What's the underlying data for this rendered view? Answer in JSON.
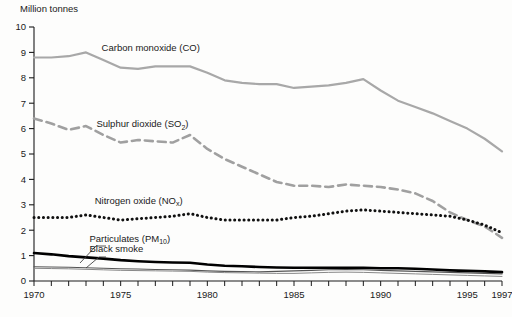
{
  "chart_data": {
    "type": "line",
    "title": "",
    "ylabel": "Million tonnes",
    "xlabel": "",
    "xlim": [
      1970,
      1997
    ],
    "ylim": [
      0,
      10
    ],
    "ytick_labels": [
      "0",
      "1",
      "2",
      "3",
      "4",
      "5",
      "6",
      "7",
      "8",
      "9",
      "10"
    ],
    "ytick_values": [
      0,
      1,
      2,
      3,
      4,
      5,
      6,
      7,
      8,
      9,
      10
    ],
    "xtick_labels": [
      "1970",
      "1975",
      "1980",
      "1985",
      "1990",
      "1995",
      "1997"
    ],
    "xtick_values": [
      1970,
      1975,
      1980,
      1985,
      1990,
      1995,
      1997
    ],
    "x": [
      1970,
      1971,
      1972,
      1973,
      1974,
      1975,
      1976,
      1977,
      1978,
      1979,
      1980,
      1981,
      1982,
      1983,
      1984,
      1985,
      1986,
      1987,
      1988,
      1989,
      1990,
      1991,
      1992,
      1993,
      1994,
      1995,
      1996,
      1997
    ],
    "grid": false,
    "legend_position": "inline-labels",
    "series": [
      {
        "name": "Carbon monoxide (CO)",
        "label_plain": "Carbon monoxide (CO)",
        "style": "solid",
        "color": "#a8a8a8",
        "width": 2.2,
        "values": [
          8.8,
          8.8,
          8.85,
          9.0,
          8.7,
          8.4,
          8.35,
          8.45,
          8.45,
          8.45,
          8.2,
          7.9,
          7.8,
          7.75,
          7.75,
          7.6,
          7.65,
          7.7,
          7.8,
          7.95,
          7.5,
          7.1,
          6.85,
          6.6,
          6.3,
          6.0,
          5.6,
          5.1
        ]
      },
      {
        "name": "Sulphur dioxide (SO2)",
        "label_plain": "Sulphur dioxide (SO",
        "label_sub": "2",
        "label_tail": ")",
        "style": "dashed",
        "color": "#a0a0a0",
        "width": 2.6,
        "values": [
          6.4,
          6.2,
          5.95,
          6.1,
          5.75,
          5.45,
          5.55,
          5.5,
          5.45,
          5.75,
          5.2,
          4.8,
          4.5,
          4.2,
          3.9,
          3.75,
          3.75,
          3.7,
          3.8,
          3.75,
          3.7,
          3.6,
          3.45,
          3.15,
          2.7,
          2.4,
          2.15,
          1.7
        ]
      },
      {
        "name": "Nitrogen oxide (NOx)",
        "label_plain": "Nitrogen oxide (NO",
        "label_sub": "x",
        "label_tail": ")",
        "style": "dotted",
        "color": "#111111",
        "width": 3.0,
        "values": [
          2.5,
          2.5,
          2.5,
          2.6,
          2.5,
          2.4,
          2.45,
          2.5,
          2.55,
          2.65,
          2.5,
          2.4,
          2.4,
          2.4,
          2.4,
          2.5,
          2.55,
          2.65,
          2.75,
          2.8,
          2.75,
          2.7,
          2.65,
          2.6,
          2.55,
          2.4,
          2.2,
          1.9
        ]
      },
      {
        "name": "Black smoke",
        "label_plain": "Black smoke",
        "style": "solid",
        "color": "#000000",
        "width": 2.6,
        "values": [
          1.1,
          1.05,
          0.98,
          0.93,
          0.88,
          0.82,
          0.78,
          0.75,
          0.73,
          0.72,
          0.65,
          0.6,
          0.58,
          0.55,
          0.53,
          0.52,
          0.52,
          0.52,
          0.52,
          0.52,
          0.5,
          0.5,
          0.48,
          0.45,
          0.42,
          0.4,
          0.38,
          0.35
        ]
      },
      {
        "name": "Particulates (PM10)",
        "label_plain": "Particulates (PM",
        "label_sub": "10",
        "label_tail": ")",
        "style": "solid",
        "color": "#555555",
        "width": 1.1,
        "values": [
          0.56,
          0.55,
          0.54,
          0.52,
          0.5,
          0.48,
          0.47,
          0.45,
          0.44,
          0.43,
          0.4,
          0.38,
          0.37,
          0.36,
          0.38,
          0.4,
          0.42,
          0.44,
          0.45,
          0.44,
          0.42,
          0.4,
          0.38,
          0.36,
          0.34,
          0.32,
          0.3,
          0.28
        ]
      },
      {
        "name": "Particulates lower band",
        "label_plain": "",
        "style": "solid",
        "color": "#888888",
        "width": 1.0,
        "values": [
          0.5,
          0.49,
          0.48,
          0.46,
          0.44,
          0.42,
          0.41,
          0.4,
          0.39,
          0.38,
          0.35,
          0.33,
          0.32,
          0.31,
          0.3,
          0.3,
          0.32,
          0.34,
          0.35,
          0.34,
          0.32,
          0.3,
          0.28,
          0.26,
          0.24,
          0.22,
          0.2,
          0.18
        ]
      }
    ],
    "annotations": [
      {
        "text": "Carbon monoxide (CO)",
        "x": 1973.9,
        "y": 9.05
      },
      {
        "text": "Sulphur dioxide (SO2)",
        "x": 1973.6,
        "y": 6.05
      },
      {
        "text": "Nitrogen oxide (NOx)",
        "x": 1973.5,
        "y": 3.05
      },
      {
        "text": "Particulates (PM10)",
        "x": 1973.2,
        "y": 1.55
      },
      {
        "text": "Black smoke",
        "x": 1973.2,
        "y": 1.15
      }
    ]
  }
}
